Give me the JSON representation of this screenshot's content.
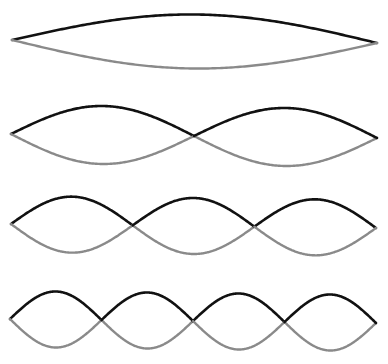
{
  "diagram": {
    "type": "standing-wave-harmonics",
    "colors": {
      "dark_curve": "#111111",
      "light_curve": "#8a8a8a",
      "background": "#ffffff"
    },
    "rows": [
      {
        "harmonic": 1,
        "loops": 1,
        "left": [
          12,
          40
        ],
        "right": [
          377,
          43
        ],
        "amplitude": 27
      },
      {
        "harmonic": 2,
        "loops": 2,
        "left": [
          11,
          134
        ],
        "right": [
          377,
          138
        ],
        "amplitude": 29
      },
      {
        "harmonic": 3,
        "loops": 3,
        "left": [
          11,
          224
        ],
        "right": [
          376,
          228
        ],
        "amplitude": 28
      },
      {
        "harmonic": 4,
        "loops": 4,
        "left": [
          10,
          319
        ],
        "right": [
          376,
          323
        ],
        "amplitude": 28
      }
    ]
  }
}
